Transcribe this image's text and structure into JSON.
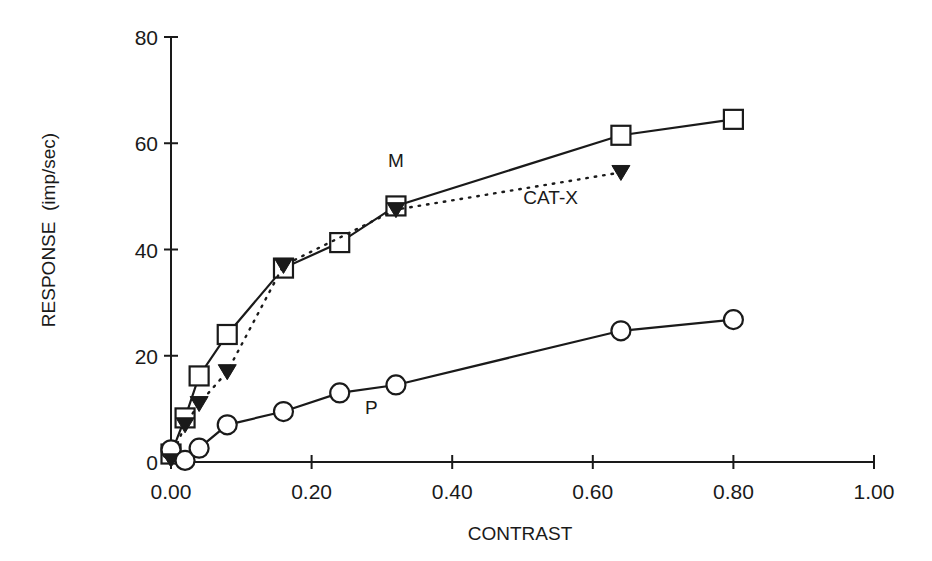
{
  "chart_data": {
    "type": "line",
    "title": "",
    "xlabel": "CONTRAST",
    "ylabel": "RESPONSE  (imp/sec)",
    "xlim": [
      0,
      1.0
    ],
    "ylim": [
      0,
      80
    ],
    "grid": false,
    "legend": "inline labels",
    "x_ticks": [
      0.0,
      0.2,
      0.4,
      0.6,
      0.8,
      1.0
    ],
    "x_tick_labels": [
      "0.00",
      "0.20",
      "0.40",
      "0.60",
      "0.80",
      "1.00"
    ],
    "y_ticks": [
      0,
      20,
      40,
      60,
      80
    ],
    "y_tick_labels": [
      "0",
      "20",
      "40",
      "60",
      "80"
    ],
    "series": [
      {
        "name": "M",
        "marker": "open-square",
        "line": "solid",
        "label_pos": [
          0.32,
          55.5
        ],
        "points": [
          [
            0.0,
            1.5
          ],
          [
            0.02,
            8.3
          ],
          [
            0.04,
            16.2
          ],
          [
            0.08,
            24.0
          ],
          [
            0.16,
            36.5
          ],
          [
            0.24,
            41.3
          ],
          [
            0.32,
            48.2
          ],
          [
            0.64,
            61.5
          ],
          [
            0.8,
            64.5
          ]
        ]
      },
      {
        "name": "CAT-X",
        "marker": "filled-triangle-down",
        "line": "dotted",
        "label_pos": [
          0.54,
          48.5
        ],
        "points": [
          [
            0.0,
            0.5
          ],
          [
            0.02,
            7.0
          ],
          [
            0.04,
            11.0
          ],
          [
            0.08,
            17.0
          ],
          [
            0.16,
            37.0
          ],
          [
            0.32,
            47.5
          ],
          [
            0.64,
            54.5
          ]
        ]
      },
      {
        "name": "P",
        "marker": "open-circle",
        "line": "solid",
        "label_pos": [
          0.285,
          9.0
        ],
        "points": [
          [
            0.0,
            2.3
          ],
          [
            0.02,
            0.3
          ],
          [
            0.04,
            2.6
          ],
          [
            0.08,
            7.0
          ],
          [
            0.16,
            9.5
          ],
          [
            0.24,
            13.0
          ],
          [
            0.32,
            14.5
          ],
          [
            0.64,
            24.7
          ],
          [
            0.8,
            26.8
          ]
        ]
      }
    ],
    "colors": {
      "ink": "#1a1a1a",
      "background": "#ffffff"
    }
  }
}
